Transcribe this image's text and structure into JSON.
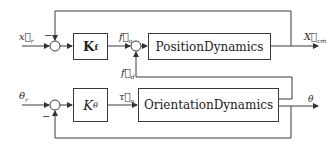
{
  "diagram": {
    "type": "block-diagram",
    "blocks": {
      "kf": "K",
      "kf_sub": "f",
      "ktheta": "K",
      "ktheta_sub": "θ",
      "position_dynamics": "PositionDynamics",
      "orientation_dynamics": "OrientationDynamics"
    },
    "signals": {
      "x_ref": "x⃗",
      "x_ref_sub": "r",
      "f_o": "f⃗",
      "f_o_sub": "o",
      "f_d": "f⃗",
      "f_d_sub": "d",
      "x_cm": "X⃗",
      "x_cm_sub": "cm",
      "theta_ref": "θ",
      "theta_ref_sub": "r",
      "tau_o": "τ⃗",
      "tau_o_sub": "o",
      "theta_out": "θ"
    },
    "signs": {
      "top_feedback_minus": "−",
      "bottom_feedback_minus": "−"
    }
  }
}
